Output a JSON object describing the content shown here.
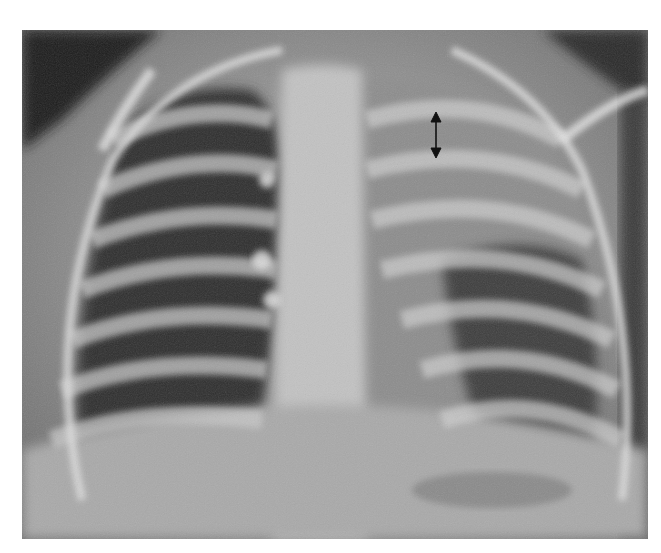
{
  "image": {
    "type": "chest-radiograph",
    "view": "frontal",
    "annotation": {
      "marker": "double-headed-arrow",
      "color": "#111111"
    },
    "colors": {
      "background": "#ffffff",
      "lung_dark": "#2a2a2a",
      "soft_tissue": "#9a9a9a",
      "bone_bright": "#dcdcdc"
    }
  }
}
